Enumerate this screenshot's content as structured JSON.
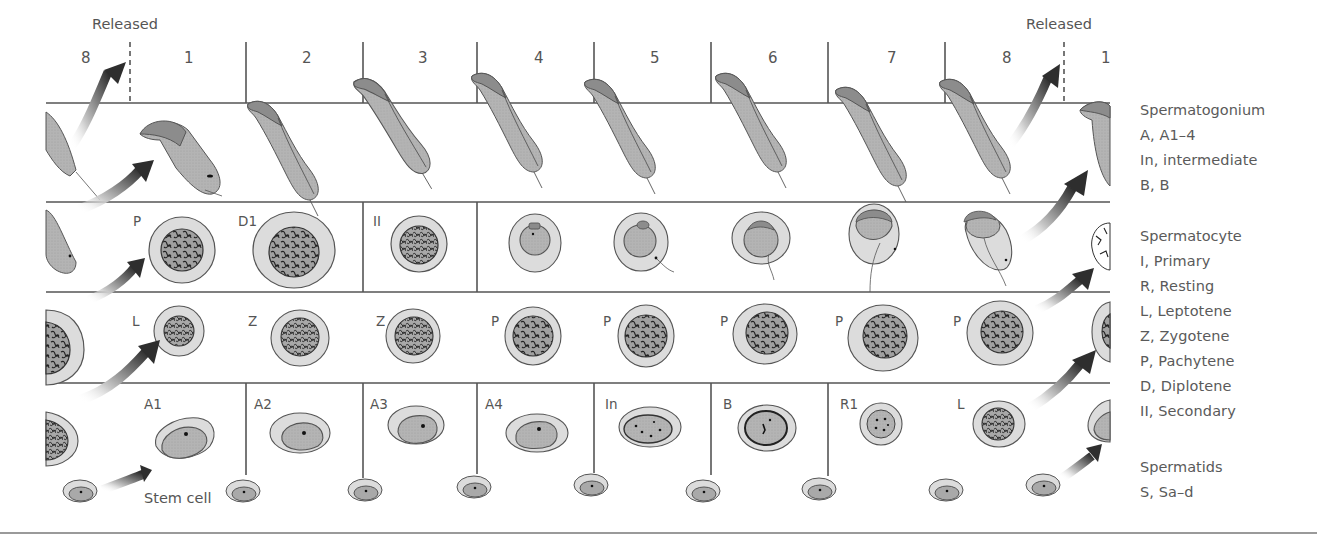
{
  "colors": {
    "line": "#555555",
    "cytoplasm": "#dcdcdc",
    "nucleus": "#a9a9a9",
    "acrosome": "#8c8c8c",
    "arrow_dark": "#333333",
    "arrow_light": "#ffffff"
  },
  "header": {
    "released_left": "Released",
    "released_right": "Released",
    "stage_numbers": [
      {
        "label": "8",
        "x": 95
      },
      {
        "label": "1",
        "x": 188
      },
      {
        "label": "2",
        "x": 308
      },
      {
        "label": "3",
        "x": 424
      },
      {
        "label": "4",
        "x": 540
      },
      {
        "label": "5",
        "x": 655
      },
      {
        "label": "6",
        "x": 775
      },
      {
        "label": "7",
        "x": 893
      },
      {
        "label": "8",
        "x": 1008
      },
      {
        "label": "1",
        "x": 1104
      }
    ]
  },
  "rows": {
    "spermatid_late": {
      "labels": []
    },
    "spermatid_early": {
      "labels": [
        {
          "text": "P",
          "x": 146,
          "y": 222
        },
        {
          "text": "D1",
          "x": 237,
          "y": 222
        },
        {
          "text": "II",
          "x": 375,
          "y": 222
        }
      ]
    },
    "spermatocyte": {
      "labels": [
        {
          "text": "L",
          "x": 133,
          "y": 322
        },
        {
          "text": "Z",
          "x": 248,
          "y": 322
        },
        {
          "text": "Z",
          "x": 375,
          "y": 322
        },
        {
          "text": "P",
          "x": 490,
          "y": 322
        },
        {
          "text": "P",
          "x": 603,
          "y": 322
        },
        {
          "text": "P",
          "x": 718,
          "y": 322
        },
        {
          "text": "P",
          "x": 833,
          "y": 322
        },
        {
          "text": "P",
          "x": 950,
          "y": 322
        }
      ]
    },
    "spermatogonium": {
      "labels": [
        {
          "text": "A1",
          "x": 145,
          "y": 410
        },
        {
          "text": "A2",
          "x": 255,
          "y": 410
        },
        {
          "text": "A3",
          "x": 370,
          "y": 410
        },
        {
          "text": "A4",
          "x": 486,
          "y": 410
        },
        {
          "text": "In",
          "x": 606,
          "y": 410
        },
        {
          "text": "B",
          "x": 723,
          "y": 410
        },
        {
          "text": "R1",
          "x": 840,
          "y": 410
        },
        {
          "text": "L",
          "x": 958,
          "y": 410
        }
      ],
      "stem_cell_label": "Stem cell"
    }
  },
  "legend": {
    "groups": [
      {
        "title": "Spermatogonium",
        "items": [
          "A, A1–4",
          "In, intermediate",
          "B, B"
        ]
      },
      {
        "title": "Spermatocyte",
        "items": [
          "I, Primary",
          "R, Resting",
          "L, Leptotene",
          "Z, Zygotene",
          "P, Pachytene",
          "D, Diplotene",
          "II, Secondary"
        ]
      },
      {
        "title": "Spermatids",
        "items": [
          "S, Sa–d"
        ]
      }
    ]
  }
}
